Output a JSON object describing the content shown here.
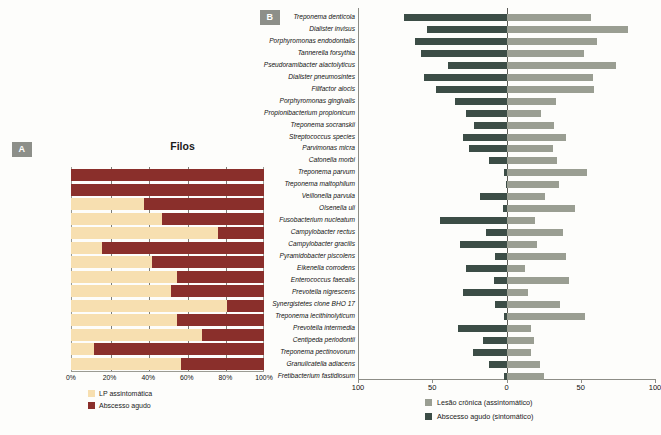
{
  "panelA": {
    "badge": "A",
    "title": "Filos",
    "xticks": [
      "0%",
      "20%",
      "40%",
      "60%",
      "80%",
      "100%"
    ],
    "legend": [
      {
        "label": "LP assintomática",
        "color": "#f7dfb0"
      },
      {
        "label": "Abscesso agudo",
        "color": "#8a2f2b"
      }
    ],
    "chart_data": {
      "type": "bar",
      "orientation": "horizontal-stacked-100",
      "title": "Filos",
      "xlabel": "",
      "ylabel": "",
      "xlim": [
        0,
        100
      ],
      "grid": true,
      "categories": [
        "Chloroflexi",
        "Gemmatimonadetes",
        "Tenericutes",
        "Verrucomicrobia",
        "Synergistetes",
        "Acidobacteria",
        "Proteobacteria",
        "Bacteroidetes",
        "Spirochaetes",
        "TM7",
        "Firmicutes",
        "Actinobacteria",
        "Fusobacteria",
        "Desconhecido"
      ],
      "series": [
        {
          "name": "LP assintomática",
          "color": "#f7dfb0",
          "values": [
            0,
            0,
            38,
            47,
            76,
            16,
            42,
            55,
            52,
            81,
            55,
            68,
            12,
            57
          ]
        },
        {
          "name": "Abscesso agudo",
          "color": "#8a2f2b",
          "values": [
            100,
            100,
            62,
            53,
            24,
            84,
            58,
            45,
            48,
            19,
            45,
            32,
            88,
            43
          ]
        }
      ]
    }
  },
  "panelB": {
    "badge": "B",
    "xticks": [
      {
        "label": "100",
        "pos": 0
      },
      {
        "label": "50",
        "pos": 25
      },
      {
        "label": "0",
        "pos": 50
      },
      {
        "label": "50",
        "pos": 75
      },
      {
        "label": "100",
        "pos": 100
      }
    ],
    "legend": [
      {
        "label": "Lesão crônica (assintomático)",
        "color": "#9a9e92"
      },
      {
        "label": "Abscesso agudo (sintomático)",
        "color": "#3c4d46"
      }
    ],
    "chart_data": {
      "type": "bar",
      "orientation": "horizontal-diverging",
      "title": "",
      "xlabel": "",
      "ylabel": "",
      "xlim": [
        -100,
        100
      ],
      "grid": false,
      "left_series": "Abscesso agudo (sintomático)",
      "right_series": "Lesão crônica (assintomático)",
      "categories": [
        "Treponema denticola",
        "Dialister invisus",
        "Porphyromonas endodontalis",
        "Tannerella forsythia",
        "Pseudoramibacter alactolyticus",
        "Dialister pneumosintes",
        "Filifactor alocis",
        "Porphyromonas gingivalis",
        "Propionibacterium propionicum",
        "Treponema socranskii",
        "Streptococcus species",
        "Parvimonas micra",
        "Catonella morbi",
        "Treponema parvum",
        "Treponema maltophilum",
        "Veillonella parvula",
        "Olsenella uli",
        "Fusobacterium nucleatum",
        "Campylobacter rectus",
        "Campylobacter gracilis",
        "Pyramidobacter piscolens",
        "Eikenella corrodens",
        "Enterococcus faecalis",
        "Prevotella nigrescens",
        "Synergistetes clone BHO 17",
        "Treponema lecithinolyticum",
        "Prevotella intermedia",
        "Centipeda periodontii",
        "Treponema pectinovorum",
        "Granulicatella adiacens",
        "Fretibacterium fastidiosum"
      ],
      "series": [
        {
          "name": "Abscesso agudo (sintomático)",
          "color": "#3c4d46",
          "values": [
            70,
            54,
            62,
            58,
            40,
            56,
            48,
            35,
            28,
            22,
            30,
            26,
            12,
            2,
            1,
            18,
            3,
            45,
            14,
            32,
            8,
            28,
            9,
            30,
            8,
            2,
            33,
            16,
            23,
            12,
            2
          ]
        },
        {
          "name": "Lesão crônica (assintomático)",
          "color": "#9a9e92",
          "values": [
            57,
            82,
            61,
            52,
            74,
            58,
            59,
            33,
            23,
            32,
            40,
            31,
            34,
            54,
            35,
            26,
            46,
            19,
            38,
            20,
            40,
            12,
            42,
            14,
            36,
            53,
            16,
            18,
            16,
            22,
            25
          ]
        }
      ]
    }
  }
}
